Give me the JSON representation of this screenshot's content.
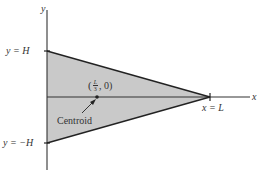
{
  "diagram": {
    "type": "triangle-centroid",
    "axes": {
      "x_label": "x",
      "y_label": "y"
    },
    "labels": {
      "top": "y = H",
      "bottom": "y = −H",
      "apex": "x = L",
      "centroid_coord_open": "(",
      "centroid_frac_num": "L",
      "centroid_frac_den": "3",
      "centroid_coord_rest": ", 0)",
      "centroid_name": "Centroid"
    },
    "colors": {
      "fill": "#c9c9c9",
      "stroke": "#222222"
    }
  }
}
